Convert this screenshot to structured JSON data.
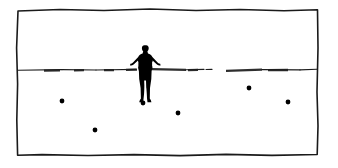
{
  "artwork": {
    "title": "Figure on Horizon",
    "medium": "ink-drawing",
    "background_color": "#ffffff",
    "ink_color": "#000000",
    "canvas": {
      "width": 338,
      "height": 168
    }
  },
  "frame": {
    "name": "hand-drawn-border",
    "stroke_color": "#1a1a1a",
    "stroke_width": 1.6,
    "bounds": {
      "left": 17,
      "top": 9,
      "right": 318,
      "bottom": 155
    },
    "path": "M18,11 L60,9.5 L104,10.5 L150,9 L196,10.5 L240,9.5 L284,10.8 L317.5,9.8 L318,48 L317,92 L318,126 L317.2,154.5 L272,155.4 L226,154.4 L180,155.6 L134,154.6 L88,155.5 L42,154.6 L17.6,155.2 L16.8,120 L17.6,84 L16.6,48 Z"
  },
  "horizon": {
    "name": "horizon-line",
    "y": 69.5,
    "color": "#1c1c1c",
    "description": "broken sketchy horizon line with gap near right of center",
    "segments": [
      {
        "x1": 18,
        "y1": 70.2,
        "x2": 62,
        "y2": 69.6,
        "weight": "thin"
      },
      {
        "x1": 44,
        "y1": 70.6,
        "x2": 60,
        "y2": 70.4,
        "weight": "thick"
      },
      {
        "x1": 62,
        "y1": 69.6,
        "x2": 96,
        "y2": 70.0,
        "weight": "thin"
      },
      {
        "x1": 74,
        "y1": 70.3,
        "x2": 84,
        "y2": 70.2,
        "weight": "thick"
      },
      {
        "x1": 96,
        "y1": 70.0,
        "x2": 136,
        "y2": 69.4,
        "weight": "thin"
      },
      {
        "x1": 104,
        "y1": 70.2,
        "x2": 114,
        "y2": 70.1,
        "weight": "thick"
      },
      {
        "x1": 126,
        "y1": 69.8,
        "x2": 137,
        "y2": 69.6,
        "weight": "thick"
      },
      {
        "x1": 152,
        "y1": 69.2,
        "x2": 186,
        "y2": 69.8,
        "weight": "thick"
      },
      {
        "x1": 186,
        "y1": 69.8,
        "x2": 204,
        "y2": 69.4,
        "weight": "thin"
      },
      {
        "x1": 188,
        "y1": 70.1,
        "x2": 198,
        "y2": 69.9,
        "weight": "thick"
      },
      {
        "x1": 206,
        "y1": 69.5,
        "x2": 212,
        "y2": 69.4,
        "weight": "thin"
      },
      {
        "x1": 226,
        "y1": 70.8,
        "x2": 262,
        "y2": 69.6,
        "weight": "thick"
      },
      {
        "x1": 262,
        "y1": 69.6,
        "x2": 300,
        "y2": 69.9,
        "weight": "thin"
      },
      {
        "x1": 268,
        "y1": 70.2,
        "x2": 288,
        "y2": 70.0,
        "weight": "thick"
      },
      {
        "x1": 300,
        "y1": 69.9,
        "x2": 317,
        "y2": 69.3,
        "weight": "thin"
      }
    ]
  },
  "figure": {
    "name": "standing-person-silhouette",
    "pose": "arms-akimbo-hands-on-hips",
    "color": "#000000",
    "center_x": 145,
    "head_top_y": 45,
    "feet_y": 102,
    "height_px": 57,
    "path": "M144.4,45.2 C142.9,45.2 141.9,46.4 141.9,48.0 C141.9,49.4 142.4,50.6 143.2,51.3 L142.6,53.4 C140.6,53.9 139.0,55.2 138.2,57.0 L133.0,62.4 C132.2,63.2 131.4,63.6 130.4,63.8 L130.0,65.4 C131.6,65.4 133.0,64.9 134.2,63.9 L138.0,60.6 L138.0,65.8 C138.0,67.8 138.3,69.6 138.9,71.2 L139.2,79.0 L140.6,88.0 L140.9,98.4 L139.8,100.3 L139.2,102.2 L143.2,102.2 L143.6,98.2 L144.6,89.0 L145.4,82.0 L146.2,89.0 L147.0,98.2 L147.5,102.2 L151.4,102.2 L150.9,100.3 L149.8,98.4 L150.0,88.0 L151.3,79.0 L151.6,71.2 C152.2,69.6 152.6,67.8 152.6,65.8 L152.6,60.6 L156.4,63.9 C157.6,64.9 159.0,65.4 160.6,65.4 L160.2,63.8 C159.2,63.6 158.4,63.2 157.6,62.4 L152.4,57.0 C151.6,55.2 150.0,53.9 148.0,53.4 L147.4,51.3 C148.2,50.6 148.7,49.4 148.7,48.0 C148.7,46.4 147.7,45.2 146.2,45.2 Z",
    "arm_void_left": "M138.4,61.6 L138.4,66.8 L134.6,64.6 Z",
    "arm_void_right": "M152.2,61.6 L152.2,66.8 L156.0,64.6 Z",
    "leg_gap": "M144.2,80.5 L146.0,80.5 L146.6,99.5 L145.4,99.5 L144.8,99.5 Z"
  },
  "dots": {
    "name": "scattered-dots",
    "color": "#000000",
    "count": 6,
    "items": [
      {
        "label": "dot-1",
        "cx": 62,
        "cy": 101,
        "r": 2.4
      },
      {
        "label": "dot-2",
        "cx": 95,
        "cy": 130,
        "r": 2.4
      },
      {
        "label": "dot-3",
        "cx": 143,
        "cy": 103,
        "r": 2.4
      },
      {
        "label": "dot-4",
        "cx": 178,
        "cy": 113,
        "r": 2.4
      },
      {
        "label": "dot-5",
        "cx": 249,
        "cy": 88,
        "r": 2.4
      },
      {
        "label": "dot-6",
        "cx": 288,
        "cy": 102,
        "r": 2.4
      }
    ]
  }
}
